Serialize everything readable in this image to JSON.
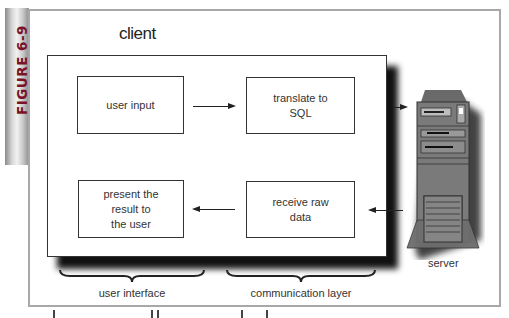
{
  "figure": {
    "label": "FIGURE 6-9",
    "accent_color": "#7a1228"
  },
  "diagram": {
    "client_label": "client",
    "boxes": [
      {
        "id": "user-input",
        "label": "user input"
      },
      {
        "id": "translate-sql",
        "label": "translate to\nSQL"
      },
      {
        "id": "present-result",
        "label": "present the\nresult to\nthe user"
      },
      {
        "id": "receive-raw",
        "label": "receive raw\ndata"
      }
    ],
    "arrows": [
      {
        "from": "user input",
        "to": "translate to SQL",
        "direction": "right"
      },
      {
        "from": "translate to SQL",
        "to": "server",
        "direction": "right"
      },
      {
        "from": "server",
        "to": "receive raw data",
        "direction": "left"
      },
      {
        "from": "receive raw data",
        "to": "present the result to the user",
        "direction": "left"
      }
    ],
    "server": {
      "label": "server",
      "icon": "server-tower-icon"
    },
    "groups": [
      {
        "label": "user interface"
      },
      {
        "label": "communication layer"
      }
    ]
  }
}
